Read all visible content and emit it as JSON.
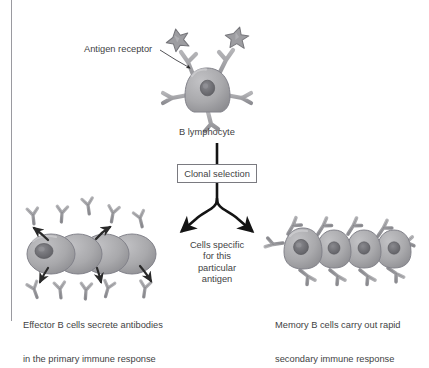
{
  "figure": {
    "type": "biology-diagram",
    "background_color": "#ffffff",
    "text_color": "#3f3f44",
    "cell_fill": "#a8a8ab",
    "cell_stroke": "#8a8a8e",
    "nucleus_fill": "#6e6e73",
    "arrow_color": "#141414",
    "border_color": "#9a9aa0"
  },
  "labels": {
    "antigen_receptor": "Antigen receptor",
    "b_lymphocyte": "B lymphocyte",
    "clonal_selection": "Clonal selection",
    "cells_specific": "Cells specific\nfor this\nparticular\nantigen",
    "cells_specific_lines": [
      "Cells specific",
      "for this",
      "particular",
      "antigen"
    ],
    "effector_caption_line1": "Effector B cells secrete antibodies",
    "effector_caption_line2": "in the primary immune response",
    "memory_caption_line1": "Memory B cells carry out rapid",
    "memory_caption_line2": "secondary immune response"
  },
  "elements": {
    "antigen_star_count": 2,
    "effector_cell_count": 4,
    "memory_cell_count": 4,
    "antibody_count": 10,
    "secretion_arrow_count": 5
  }
}
